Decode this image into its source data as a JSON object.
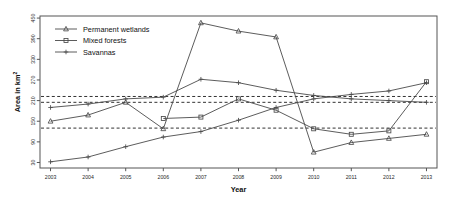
{
  "chart_data": {
    "type": "line",
    "title": "",
    "xlabel": "Year",
    "ylabel": "Area in km2",
    "ylabel_display": "Area in km",
    "ylabel_superscript": "2",
    "x": [
      2003,
      2004,
      2005,
      2006,
      2007,
      2008,
      2009,
      2010,
      2011,
      2012,
      2013
    ],
    "xtick_labels": [
      "2003",
      "2004",
      "2005",
      "2006",
      "2007",
      "2008",
      "2009",
      "2010",
      "2011",
      "2012",
      "2013"
    ],
    "ytick_labels": [
      "30",
      "90",
      "150",
      "210",
      "270",
      "330",
      "390",
      "450"
    ],
    "yticks": [
      30,
      90,
      150,
      210,
      270,
      330,
      390,
      450
    ],
    "ylim": [
      14,
      456
    ],
    "xlim": [
      2002.72,
      2013.28
    ],
    "grid": false,
    "legend_position": "top-left",
    "reference_lines": [
      {
        "value": 222,
        "style": "dashed"
      },
      {
        "value": 205,
        "style": "dashed"
      },
      {
        "value": 130,
        "style": "dashed"
      }
    ],
    "series": [
      {
        "name": "Permanent wetlands",
        "marker": "triangle",
        "values": [
          150,
          168,
          205,
          128,
          436,
          412,
          395,
          60,
          88,
          100,
          112
        ]
      },
      {
        "name": "Mixed forests",
        "marker": "square",
        "values": [
          null,
          null,
          null,
          158,
          162,
          215,
          182,
          128,
          112,
          122,
          265
        ]
      },
      {
        "name": "Savannas",
        "marker": "plus",
        "values": [
          32,
          46,
          76,
          104,
          120,
          153,
          190,
          215,
          228,
          238,
          262
        ]
      }
    ],
    "series_alt": [
      {
        "name": "Savannas",
        "marker": "plus",
        "values": [
          190,
          200,
          215,
          220,
          272,
          262,
          240,
          225,
          215,
          210,
          205
        ]
      }
    ],
    "colors": {
      "line": "#4a4a4a",
      "axis": "#555555",
      "reference": "#333333",
      "background": "#ffffff",
      "text": "#1a1a1a"
    }
  },
  "legend": {
    "entries": [
      {
        "label": "Permanent wetlands",
        "marker": "triangle"
      },
      {
        "label": "Mixed forests",
        "marker": "square"
      },
      {
        "label": "Savannas",
        "marker": "plus"
      }
    ]
  },
  "axes": {
    "x_title": "Year",
    "y_title": "Area in km"
  }
}
